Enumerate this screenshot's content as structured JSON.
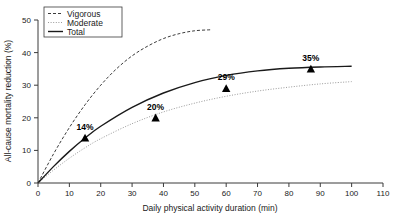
{
  "chart_data": {
    "type": "line",
    "title": "",
    "xlabel": "Daily physical activity duration (min)",
    "ylabel": "All-cause mortality reduction (%)",
    "xlim": [
      0,
      110
    ],
    "ylim": [
      0,
      50
    ],
    "xticks": [
      0,
      10,
      20,
      30,
      40,
      50,
      60,
      70,
      80,
      90,
      100,
      110
    ],
    "yticks": [
      0,
      10,
      20,
      30,
      40,
      50
    ],
    "grid": false,
    "legend_position": "top-left",
    "series": [
      {
        "name": "Vigorous",
        "style": "dashed",
        "color": "#3b3b3b",
        "x": [
          0,
          5,
          10,
          15,
          20,
          25,
          30,
          35,
          40,
          45,
          50,
          55
        ],
        "y": [
          0,
          9.0,
          17.0,
          24.0,
          30.0,
          35.0,
          39.0,
          42.0,
          44.3,
          45.8,
          46.7,
          47.0
        ]
      },
      {
        "name": "Moderate",
        "style": "dotted",
        "color": "#9a9a9a",
        "x": [
          0,
          5,
          10,
          15,
          20,
          30,
          40,
          50,
          60,
          70,
          80,
          90,
          100
        ],
        "y": [
          0,
          4.0,
          7.6,
          10.8,
          13.6,
          18.2,
          21.8,
          24.5,
          26.6,
          28.2,
          29.4,
          30.4,
          31.1
        ]
      },
      {
        "name": "Total",
        "style": "solid",
        "color": "#1a1a1a",
        "x": [
          0,
          5,
          10,
          15,
          20,
          30,
          40,
          50,
          60,
          70,
          80,
          90,
          100
        ],
        "y": [
          0,
          5.1,
          9.7,
          13.8,
          17.4,
          23.2,
          27.6,
          30.8,
          33.0,
          34.4,
          35.2,
          35.6,
          35.8
        ]
      }
    ],
    "markers": [
      {
        "label": "14%",
        "x": 15,
        "y": 13.8
      },
      {
        "label": "20%",
        "x": 37.5,
        "y": 20.0
      },
      {
        "label": "29%",
        "x": 60,
        "y": 29.0
      },
      {
        "label": "35%",
        "x": 87,
        "y": 35.0
      }
    ]
  },
  "legend": {
    "items": [
      {
        "label": "Vigorous"
      },
      {
        "label": "Moderate"
      },
      {
        "label": "Total"
      }
    ]
  }
}
